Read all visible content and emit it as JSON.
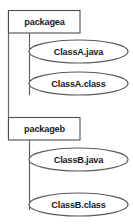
{
  "diagram": {
    "type": "package-artifact-diagram",
    "title": "",
    "background_color": "#ffffff",
    "shape_fill": "#ffffff",
    "shape_stroke": "#5a5a5a",
    "text_color": "#1a1a1a",
    "packages": [
      {
        "id": "packagea",
        "label": "packagea",
        "shape": "rectangle",
        "x": 8,
        "y": 10,
        "width": 72,
        "height": 23,
        "artifacts": [
          {
            "id": "classa-java",
            "label": "ClassA.java",
            "shape": "ellipse",
            "cx": 78.5,
            "cy": 51.5,
            "rx": 49.5,
            "ry": 11.5
          },
          {
            "id": "classa-class",
            "label": "ClassA.class",
            "shape": "ellipse",
            "cx": 78.5,
            "cy": 83.5,
            "rx": 49.5,
            "ry": 11.5
          }
        ]
      },
      {
        "id": "packageb",
        "label": "packageb",
        "shape": "rectangle",
        "x": 8,
        "y": 117,
        "width": 72,
        "height": 23,
        "artifacts": [
          {
            "id": "classb-java",
            "label": "ClassB.java",
            "shape": "ellipse",
            "cx": 78.5,
            "cy": 159.5,
            "rx": 49.5,
            "ry": 11.5
          },
          {
            "id": "classb-class",
            "label": "ClassB.class",
            "shape": "ellipse",
            "cx": 78.5,
            "cy": 204.5,
            "rx": 49.5,
            "ry": 11.5
          }
        ]
      }
    ],
    "connectors": [
      {
        "id": "spine-packagea-packageb",
        "from": "packagea",
        "to": "packageb",
        "style": "solid-vertical"
      },
      {
        "id": "branch-packagea-artifacts",
        "from": "packagea",
        "to": "packagea-artifacts",
        "style": "solid-vertical"
      },
      {
        "id": "branch-packageb-artifacts",
        "from": "packageb",
        "to": "packageb-artifacts",
        "style": "solid-vertical"
      }
    ]
  }
}
